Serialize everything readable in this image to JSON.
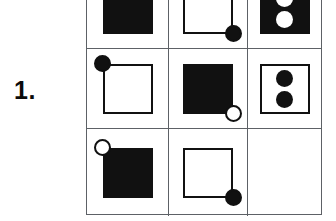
{
  "puzzle": {
    "item_number": "1.",
    "type": "matrix-reasoning",
    "rows": 3,
    "columns": 3,
    "colors": {
      "ink": "#111111",
      "grid_line": "#5d6166",
      "paper": "#ffffff"
    },
    "cells": [
      {
        "id": "cell-r1c1",
        "row": 1,
        "column": 1,
        "description": "filled black square",
        "square": "filled",
        "corner_marker": "none",
        "corner_position": "none",
        "inner_dots": 0,
        "inner_dot_fill": "none",
        "empty": false
      },
      {
        "id": "cell-r1c2",
        "row": 1,
        "column": 2,
        "description": "outline square with filled black circle at bottom-right corner",
        "square": "outline",
        "corner_marker": "filled",
        "corner_position": "bottom-right",
        "inner_dots": 0,
        "inner_dot_fill": "none",
        "empty": false
      },
      {
        "id": "cell-r1c3",
        "row": 1,
        "column": 3,
        "description": "filled black square containing two white circles stacked vertically",
        "square": "filled",
        "corner_marker": "none",
        "corner_position": "none",
        "inner_dots": 2,
        "inner_dot_fill": "white",
        "empty": false
      },
      {
        "id": "cell-r2c1",
        "row": 2,
        "column": 1,
        "description": "outline square with filled black circle at top-left corner",
        "square": "outline",
        "corner_marker": "filled",
        "corner_position": "top-left",
        "inner_dots": 0,
        "inner_dot_fill": "none",
        "empty": false
      },
      {
        "id": "cell-r2c2",
        "row": 2,
        "column": 2,
        "description": "filled black square with open white circle at bottom-right corner",
        "square": "filled",
        "corner_marker": "open",
        "corner_position": "bottom-right",
        "inner_dots": 0,
        "inner_dot_fill": "none",
        "empty": false
      },
      {
        "id": "cell-r2c3",
        "row": 2,
        "column": 3,
        "description": "outline square containing two black circles stacked vertically",
        "square": "outline",
        "corner_marker": "none",
        "corner_position": "none",
        "inner_dots": 2,
        "inner_dot_fill": "black",
        "empty": false
      },
      {
        "id": "cell-r3c1",
        "row": 3,
        "column": 1,
        "description": "filled black square with open white circle at top-left corner",
        "square": "filled",
        "corner_marker": "open",
        "corner_position": "top-left",
        "inner_dots": 0,
        "inner_dot_fill": "none",
        "empty": false
      },
      {
        "id": "cell-r3c2",
        "row": 3,
        "column": 2,
        "description": "outline square with filled black circle at bottom-right corner",
        "square": "outline",
        "corner_marker": "filled",
        "corner_position": "bottom-right",
        "inner_dots": 0,
        "inner_dot_fill": "none",
        "empty": false
      },
      {
        "id": "cell-r3c3",
        "row": 3,
        "column": 3,
        "description": "blank cell - missing element to be solved",
        "square": "none",
        "corner_marker": "none",
        "corner_position": "none",
        "inner_dots": 0,
        "inner_dot_fill": "none",
        "empty": true
      }
    ]
  }
}
